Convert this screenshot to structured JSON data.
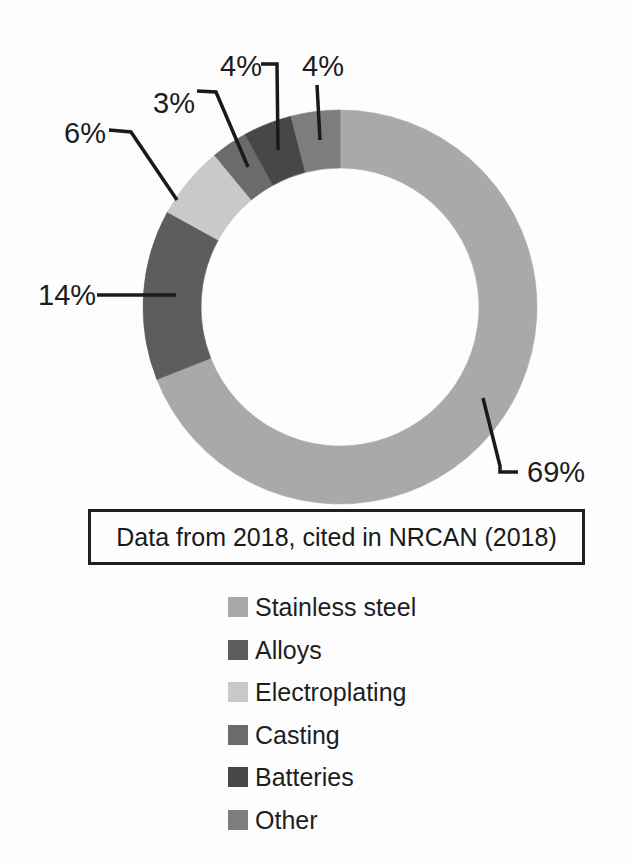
{
  "chart_data": {
    "type": "pie",
    "subtype": "donut",
    "title": "",
    "caption": "Data from 2018, cited in NRCAN (2018)",
    "direction": "clockwise",
    "start_angle_deg": 0,
    "legend_position": "bottom",
    "donut_geometry": {
      "cx": 340,
      "cy": 307,
      "outer_r": 197,
      "inner_r": 139
    },
    "line_color": "#1a1a1a",
    "segments": [
      {
        "label": "Stainless steel",
        "value": 69,
        "display": "69%",
        "color": "#a9a9a9"
      },
      {
        "label": "Alloys",
        "value": 14,
        "display": "14%",
        "color": "#5d5d5d"
      },
      {
        "label": "Electroplating",
        "value": 6,
        "display": "6%",
        "color": "#c9c9c9"
      },
      {
        "label": "Casting",
        "value": 3,
        "display": "3%",
        "color": "#6b6b6b"
      },
      {
        "label": "Batteries",
        "value": 4,
        "display": "4%",
        "color": "#474747"
      },
      {
        "label": "Other",
        "value": 4,
        "display": "4%",
        "color": "#7d7d7d"
      }
    ],
    "callouts": [
      {
        "text": "69%",
        "x": 527,
        "y": 472,
        "points": [
          [
            483,
            398
          ],
          [
            500,
            466
          ],
          [
            500,
            472
          ],
          [
            518,
            472
          ]
        ]
      },
      {
        "text": "14%",
        "x": 38,
        "y": 295,
        "points": [
          [
            97,
            295
          ],
          [
            176,
            295
          ]
        ]
      },
      {
        "text": "6%",
        "x": 64,
        "y": 133,
        "points": [
          [
            109,
            130
          ],
          [
            131,
            132
          ],
          [
            177,
            200
          ]
        ]
      },
      {
        "text": "3%",
        "x": 153,
        "y": 103,
        "points": [
          [
            197,
            91
          ],
          [
            216,
            92
          ],
          [
            248,
            167
          ]
        ]
      },
      {
        "text": "4%",
        "x": 220,
        "y": 66,
        "points": [
          [
            261,
            64
          ],
          [
            277,
            64
          ],
          [
            278,
            150
          ]
        ]
      },
      {
        "text": "4%",
        "x": 302,
        "y": 66,
        "points": [
          [
            317,
            85
          ],
          [
            320,
            140
          ]
        ]
      }
    ]
  }
}
